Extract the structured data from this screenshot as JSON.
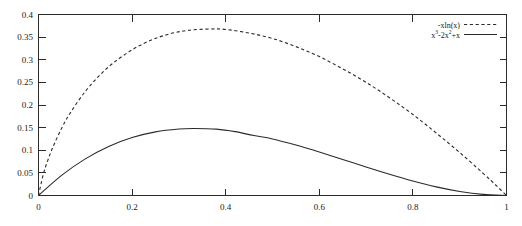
{
  "chart_data": {
    "type": "line",
    "title": "",
    "subtitle": "",
    "xlabel": "",
    "ylabel": "",
    "xlim": [
      0,
      1
    ],
    "ylim": [
      0,
      0.4
    ],
    "grid": false,
    "legend_position": "top-right",
    "x_ticks": [
      "0",
      "0.2",
      "0.4",
      "0.6",
      "0.8",
      "1"
    ],
    "x_tick_values": [
      0,
      0.2,
      0.4,
      0.6,
      0.8,
      1
    ],
    "y_ticks": [
      "0",
      "0.05",
      "0.1",
      "0.15",
      "0.2",
      "0.25",
      "0.3",
      "0.35",
      "0.4"
    ],
    "y_tick_values": [
      0,
      0.05,
      0.1,
      0.15,
      0.2,
      0.25,
      0.3,
      0.35,
      0.4
    ],
    "series": [
      {
        "name": "-xln(x)",
        "style": "dashed",
        "color": "#2b2b2b",
        "peak_x": 0.368,
        "peak_y": 0.368,
        "x": [
          0.0,
          0.01,
          0.02,
          0.03,
          0.05,
          0.07,
          0.1,
          0.13,
          0.16,
          0.2,
          0.24,
          0.28,
          0.32,
          0.368,
          0.4,
          0.45,
          0.5,
          0.55,
          0.6,
          0.65,
          0.7,
          0.75,
          0.8,
          0.85,
          0.9,
          0.95,
          0.98,
          1.0
        ],
        "y": [
          0.0,
          0.046,
          0.078,
          0.105,
          0.15,
          0.186,
          0.23,
          0.265,
          0.293,
          0.322,
          0.343,
          0.357,
          0.365,
          0.368,
          0.367,
          0.359,
          0.347,
          0.329,
          0.307,
          0.28,
          0.25,
          0.216,
          0.179,
          0.138,
          0.095,
          0.049,
          0.02,
          0.0
        ]
      },
      {
        "name": "x^3-2x^2+x",
        "name_parts": [
          "x",
          "3",
          "-2x",
          "2",
          "+x"
        ],
        "style": "solid",
        "color": "#2b2b2b",
        "peak_x": 0.3333,
        "peak_y": 0.1481,
        "x": [
          0.0,
          0.05,
          0.1,
          0.15,
          0.2,
          0.25,
          0.3,
          0.3333,
          0.38,
          0.42,
          0.46,
          0.5,
          0.55,
          0.6,
          0.65,
          0.7,
          0.75,
          0.8,
          0.85,
          0.9,
          0.95,
          1.0
        ],
        "y": [
          0.0,
          0.0451,
          0.081,
          0.1084,
          0.128,
          0.1406,
          0.147,
          0.1481,
          0.1466,
          0.1411,
          0.1325,
          0.125,
          0.1114,
          0.096,
          0.0796,
          0.063,
          0.0469,
          0.032,
          0.0191,
          0.009,
          0.0024,
          0.0
        ]
      }
    ]
  },
  "legend": {
    "entries": [
      {
        "label": "-xln(x)",
        "style": "dashed"
      },
      {
        "label": "x3-2x2+x",
        "style": "solid"
      }
    ]
  }
}
